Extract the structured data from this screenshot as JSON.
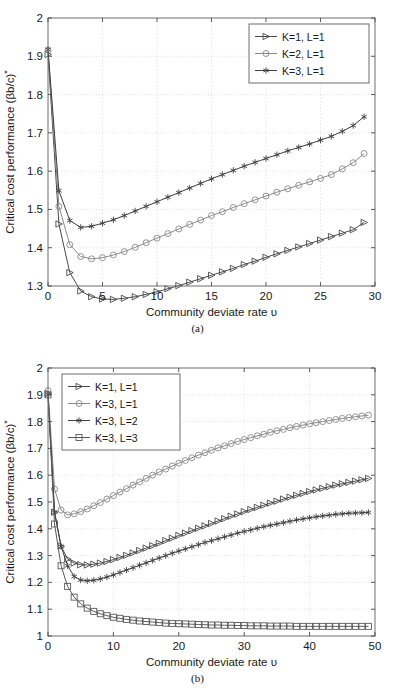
{
  "figure": {
    "panels": [
      {
        "id": "a",
        "caption": "(a)"
      },
      {
        "id": "b",
        "caption": "(b)"
      }
    ]
  },
  "chart_data": [
    {
      "type": "line",
      "panel": "(a)",
      "title": "",
      "xlabel": "Community deviate rate υ",
      "ylabel": "Critical cost performance (βb/c)*",
      "xlim": [
        0,
        30
      ],
      "ylim": [
        1.3,
        2.0
      ],
      "xticks": [
        0,
        5,
        10,
        15,
        20,
        25,
        30
      ],
      "xticklabels": [
        "0",
        "5",
        "10",
        "15",
        "20",
        "25",
        "30"
      ],
      "yticks": [
        1.3,
        1.4,
        1.5,
        1.6,
        1.7,
        1.8,
        1.9,
        2.0
      ],
      "yticklabels": [
        "1.3",
        "1.4",
        "1.5",
        "1.6",
        "1.7",
        "1.8",
        "1.9",
        "2"
      ],
      "grid": true,
      "legend_position": "top-right",
      "x": [
        0,
        1,
        2,
        3,
        4,
        5,
        6,
        7,
        8,
        9,
        10,
        11,
        12,
        13,
        14,
        15,
        16,
        17,
        18,
        19,
        20,
        21,
        22,
        23,
        24,
        25,
        26,
        27,
        28,
        29
      ],
      "series": [
        {
          "name": "K=1, L=1",
          "marker": "triangle-right",
          "color": "#4a4a4a",
          "values": [
            1.905,
            1.462,
            1.335,
            1.287,
            1.272,
            1.266,
            1.265,
            1.268,
            1.272,
            1.278,
            1.285,
            1.293,
            1.301,
            1.31,
            1.319,
            1.328,
            1.337,
            1.346,
            1.356,
            1.365,
            1.375,
            1.384,
            1.393,
            1.402,
            1.411,
            1.42,
            1.429,
            1.438,
            1.447,
            1.466
          ]
        },
        {
          "name": "K=2, L=1",
          "marker": "circle",
          "color": "#8a8a8a",
          "values": [
            1.916,
            1.508,
            1.408,
            1.377,
            1.371,
            1.374,
            1.381,
            1.39,
            1.401,
            1.413,
            1.425,
            1.437,
            1.449,
            1.461,
            1.472,
            1.484,
            1.494,
            1.505,
            1.515,
            1.525,
            1.535,
            1.545,
            1.554,
            1.563,
            1.572,
            1.581,
            1.591,
            1.606,
            1.622,
            1.646
          ]
        },
        {
          "name": "K=3, L=1",
          "marker": "asterisk",
          "color": "#404040",
          "values": [
            1.918,
            1.549,
            1.471,
            1.453,
            1.456,
            1.464,
            1.473,
            1.484,
            1.496,
            1.508,
            1.52,
            1.532,
            1.544,
            1.556,
            1.568,
            1.58,
            1.591,
            1.602,
            1.613,
            1.623,
            1.633,
            1.643,
            1.653,
            1.662,
            1.671,
            1.681,
            1.691,
            1.704,
            1.719,
            1.742
          ]
        }
      ]
    },
    {
      "type": "line",
      "panel": "(b)",
      "title": "",
      "xlabel": "Community deviate rate υ",
      "ylabel": "Critical cost performance (βb/c)*",
      "xlim": [
        0,
        50
      ],
      "ylim": [
        1.0,
        2.0
      ],
      "xticks": [
        0,
        10,
        20,
        30,
        40,
        50
      ],
      "xticklabels": [
        "0",
        "10",
        "20",
        "30",
        "40",
        "50"
      ],
      "yticks": [
        1.0,
        1.1,
        1.2,
        1.3,
        1.4,
        1.5,
        1.6,
        1.7,
        1.8,
        1.9,
        2.0
      ],
      "yticklabels": [
        "1",
        "1.1",
        "1.2",
        "1.3",
        "1.4",
        "1.5",
        "1.6",
        "1.7",
        "1.8",
        "1.9",
        "2"
      ],
      "grid": true,
      "legend_position": "top-left",
      "x": [
        0,
        1,
        2,
        3,
        4,
        5,
        6,
        7,
        8,
        9,
        10,
        11,
        12,
        13,
        14,
        15,
        16,
        17,
        18,
        19,
        20,
        21,
        22,
        23,
        24,
        25,
        26,
        27,
        28,
        29,
        30,
        31,
        32,
        33,
        34,
        35,
        36,
        37,
        38,
        39,
        40,
        41,
        42,
        43,
        44,
        45,
        46,
        47,
        48,
        49
      ],
      "series": [
        {
          "name": "K=1, L=1",
          "marker": "triangle-right",
          "color": "#4a4a4a",
          "values": [
            1.905,
            1.462,
            1.335,
            1.287,
            1.272,
            1.266,
            1.265,
            1.268,
            1.272,
            1.278,
            1.285,
            1.293,
            1.301,
            1.31,
            1.319,
            1.328,
            1.337,
            1.346,
            1.356,
            1.365,
            1.375,
            1.384,
            1.393,
            1.402,
            1.411,
            1.42,
            1.429,
            1.438,
            1.447,
            1.455,
            1.464,
            1.472,
            1.48,
            1.488,
            1.496,
            1.503,
            1.511,
            1.518,
            1.525,
            1.532,
            1.539,
            1.545,
            1.551,
            1.557,
            1.563,
            1.568,
            1.573,
            1.578,
            1.583,
            1.588
          ]
        },
        {
          "name": "K=3, L=1",
          "marker": "circle",
          "color": "#8a8a8a",
          "values": [
            1.916,
            1.548,
            1.47,
            1.452,
            1.456,
            1.464,
            1.474,
            1.486,
            1.498,
            1.511,
            1.524,
            1.537,
            1.55,
            1.563,
            1.575,
            1.588,
            1.6,
            1.612,
            1.623,
            1.634,
            1.645,
            1.655,
            1.665,
            1.675,
            1.684,
            1.693,
            1.702,
            1.71,
            1.718,
            1.726,
            1.733,
            1.74,
            1.747,
            1.753,
            1.76,
            1.766,
            1.771,
            1.777,
            1.782,
            1.787,
            1.792,
            1.796,
            1.8,
            1.804,
            1.808,
            1.812,
            1.815,
            1.818,
            1.821,
            1.824
          ]
        },
        {
          "name": "K=3, L=2",
          "marker": "asterisk",
          "color": "#404040",
          "values": [
            1.902,
            1.462,
            1.334,
            1.262,
            1.222,
            1.209,
            1.206,
            1.208,
            1.213,
            1.22,
            1.228,
            1.237,
            1.246,
            1.255,
            1.264,
            1.273,
            1.282,
            1.291,
            1.3,
            1.309,
            1.317,
            1.325,
            1.333,
            1.341,
            1.349,
            1.356,
            1.363,
            1.37,
            1.377,
            1.384,
            1.39,
            1.396,
            1.402,
            1.408,
            1.413,
            1.418,
            1.423,
            1.428,
            1.433,
            1.437,
            1.441,
            1.445,
            1.448,
            1.451,
            1.454,
            1.456,
            1.458,
            1.459,
            1.46,
            1.461
          ]
        },
        {
          "name": "K=3, L=3",
          "marker": "square",
          "color": "#5a5a5a",
          "values": [
            1.9,
            1.418,
            1.262,
            1.185,
            1.145,
            1.12,
            1.104,
            1.092,
            1.083,
            1.076,
            1.07,
            1.066,
            1.062,
            1.059,
            1.056,
            1.054,
            1.052,
            1.05,
            1.048,
            1.047,
            1.046,
            1.045,
            1.044,
            1.043,
            1.042,
            1.041,
            1.041,
            1.04,
            1.04,
            1.039,
            1.039,
            1.038,
            1.038,
            1.038,
            1.037,
            1.037,
            1.037,
            1.037,
            1.036,
            1.036,
            1.036,
            1.036,
            1.036,
            1.036,
            1.036,
            1.036,
            1.036,
            1.036,
            1.036,
            1.036
          ]
        }
      ]
    }
  ]
}
